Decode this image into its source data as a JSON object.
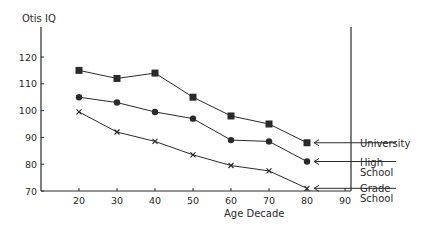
{
  "chart_data": {
    "type": "line",
    "title": "",
    "xlabel": "Age Decade",
    "ylabel": "Otis IQ",
    "x": [
      20,
      30,
      40,
      50,
      60,
      70,
      80
    ],
    "xticks": [
      20,
      30,
      40,
      50,
      60,
      70,
      80,
      90
    ],
    "yticks": [
      70,
      80,
      90,
      100,
      110,
      120
    ],
    "xlim": [
      10,
      92
    ],
    "ylim": [
      70,
      132
    ],
    "grid": false,
    "legend_position": "right, arrow-labelled at series endpoints",
    "series": [
      {
        "name": "University",
        "marker": "square",
        "values": [
          115,
          112,
          114,
          105,
          98,
          95,
          88
        ]
      },
      {
        "name": "High School",
        "marker": "circle",
        "values": [
          105,
          103,
          99.5,
          97,
          89,
          88.5,
          81
        ]
      },
      {
        "name": "Grade School",
        "marker": "cross",
        "values": [
          99.5,
          92,
          88.5,
          83.5,
          79.5,
          77.5,
          71
        ]
      }
    ],
    "labels": {
      "University": [
        "University"
      ],
      "High School": [
        "High",
        "School"
      ],
      "Grade School": [
        "Grade",
        "School"
      ]
    }
  },
  "colors": {
    "ink": "#2a2a2a",
    "background": "#ffffff"
  }
}
